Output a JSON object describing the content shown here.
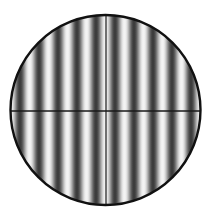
{
  "figure": {
    "fringe_orientation": "vertical",
    "fringe_count_across_diameter": 10,
    "crosshair": true,
    "colors": {
      "background": "#ffffff",
      "fringe_dark": "#3a3a3a",
      "fringe_light": "#f4f4f4",
      "outline": "#111111",
      "crosshair": "#1a1a1a"
    }
  }
}
